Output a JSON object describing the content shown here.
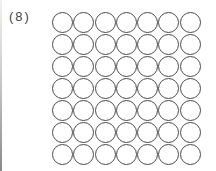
{
  "problem": {
    "label": "(8)",
    "rows": 7,
    "columns": 7,
    "total_circles": 49,
    "circle_stroke_color": "#4a4a4a"
  }
}
